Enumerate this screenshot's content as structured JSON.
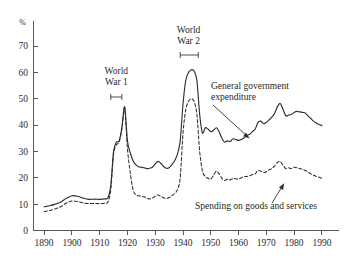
{
  "chart_data": {
    "type": "line",
    "title": "",
    "xlabel": "",
    "ylabel": "%",
    "ylim": [
      0,
      75
    ],
    "xlim": [
      1886,
      1994
    ],
    "grid": false,
    "legend_position": "inline-annotations",
    "y_ticks": [
      "0",
      "10",
      "20",
      "30",
      "40",
      "50",
      "60",
      "70"
    ],
    "y_tick_values": [
      0,
      10,
      20,
      30,
      40,
      50,
      60,
      70
    ],
    "x_ticks": [
      "1890",
      "1900",
      "1910",
      "1920",
      "1930",
      "1940",
      "1950",
      "1960",
      "1970",
      "1980",
      "1990"
    ],
    "x_tick_values": [
      1890,
      1900,
      1910,
      1920,
      1930,
      1940,
      1950,
      1960,
      1970,
      1980,
      1990
    ],
    "annotations": [
      {
        "name": "world-war-1",
        "line1": "World",
        "line2": "War 1",
        "span": [
          1914,
          1918
        ]
      },
      {
        "name": "world-war-2",
        "line1": "World",
        "line2": "War 2",
        "span": [
          1939,
          1945
        ]
      },
      {
        "name": "general-government-expenditure",
        "line1": "General government",
        "line2": "expenditure"
      },
      {
        "name": "spending-on-goods-and-services",
        "line1": "Spending on goods and services",
        "line2": ""
      }
    ],
    "series": [
      {
        "name": "General government expenditure",
        "style": "solid",
        "x": [
          1890,
          1892,
          1894,
          1896,
          1898,
          1900,
          1902,
          1904,
          1906,
          1908,
          1910,
          1912,
          1913,
          1914,
          1915,
          1916,
          1917,
          1918,
          1919,
          1920,
          1921,
          1922,
          1923,
          1924,
          1925,
          1926,
          1927,
          1928,
          1929,
          1930,
          1931,
          1932,
          1933,
          1934,
          1935,
          1936,
          1937,
          1938,
          1939,
          1940,
          1941,
          1942,
          1943,
          1944,
          1945,
          1946,
          1947,
          1948,
          1949,
          1950,
          1951,
          1952,
          1953,
          1954,
          1955,
          1956,
          1957,
          1958,
          1959,
          1960,
          1961,
          1962,
          1963,
          1964,
          1965,
          1966,
          1967,
          1968,
          1969,
          1970,
          1971,
          1972,
          1973,
          1974,
          1975,
          1976,
          1977,
          1978,
          1979,
          1980,
          1981,
          1982,
          1983,
          1984,
          1985,
          1986,
          1987,
          1988,
          1989,
          1990
        ],
        "y": [
          9.0,
          9.4,
          10.0,
          10.8,
          12.2,
          13.2,
          13.0,
          12.3,
          11.8,
          11.9,
          11.8,
          12.0,
          12.4,
          17.0,
          30.0,
          33.5,
          34.0,
          39.0,
          47.0,
          34.0,
          29.5,
          26.5,
          25.0,
          24.2,
          24.0,
          23.8,
          23.5,
          23.6,
          24.0,
          25.3,
          26.2,
          25.5,
          24.3,
          23.6,
          23.8,
          25.0,
          26.5,
          29.0,
          34.0,
          48.0,
          57.0,
          60.0,
          61.0,
          60.5,
          57.0,
          44.0,
          37.0,
          39.0,
          38.5,
          37.5,
          38.0,
          39.0,
          37.5,
          35.0,
          33.5,
          34.0,
          33.8,
          34.8,
          34.5,
          34.2,
          34.5,
          35.2,
          36.0,
          36.5,
          37.5,
          38.5,
          41.0,
          41.5,
          40.5,
          41.0,
          42.0,
          43.0,
          44.5,
          47.0,
          48.2,
          46.0,
          43.5,
          43.8,
          44.0,
          44.8,
          45.2,
          45.0,
          44.8,
          44.6,
          43.5,
          42.5,
          41.5,
          40.8,
          40.2,
          39.8
        ]
      },
      {
        "name": "Spending on goods and services",
        "style": "dashed",
        "x": [
          1890,
          1892,
          1894,
          1896,
          1898,
          1900,
          1902,
          1904,
          1906,
          1908,
          1910,
          1912,
          1913,
          1914,
          1915,
          1916,
          1917,
          1918,
          1919,
          1920,
          1921,
          1922,
          1923,
          1924,
          1925,
          1926,
          1927,
          1928,
          1929,
          1930,
          1931,
          1932,
          1933,
          1934,
          1935,
          1936,
          1937,
          1938,
          1939,
          1940,
          1941,
          1942,
          1943,
          1944,
          1945,
          1946,
          1947,
          1948,
          1949,
          1950,
          1951,
          1952,
          1953,
          1954,
          1955,
          1956,
          1957,
          1958,
          1959,
          1960,
          1961,
          1962,
          1963,
          1964,
          1965,
          1966,
          1967,
          1968,
          1969,
          1970,
          1971,
          1972,
          1973,
          1974,
          1975,
          1976,
          1977,
          1978,
          1979,
          1980,
          1981,
          1982,
          1983,
          1984,
          1985,
          1986,
          1987,
          1988,
          1989,
          1990
        ],
        "y": [
          7.2,
          7.6,
          8.2,
          9.0,
          10.4,
          11.2,
          11.0,
          10.5,
          10.2,
          10.3,
          10.2,
          10.4,
          10.8,
          15.5,
          29.0,
          32.5,
          33.5,
          38.5,
          46.5,
          31.0,
          22.0,
          15.5,
          13.5,
          13.2,
          13.0,
          12.8,
          12.2,
          12.0,
          12.3,
          13.0,
          13.5,
          13.0,
          12.4,
          12.2,
          12.5,
          13.2,
          14.0,
          15.5,
          20.0,
          37.0,
          46.0,
          49.0,
          50.0,
          49.0,
          44.0,
          30.0,
          22.5,
          20.5,
          19.8,
          19.5,
          21.0,
          22.5,
          21.5,
          19.8,
          19.0,
          19.5,
          19.2,
          19.8,
          19.6,
          19.5,
          20.0,
          20.5,
          20.5,
          20.8,
          21.2,
          21.5,
          22.8,
          22.5,
          22.0,
          22.3,
          23.0,
          23.5,
          24.5,
          25.8,
          26.2,
          24.8,
          23.5,
          23.8,
          23.5,
          24.0,
          23.8,
          23.5,
          23.2,
          22.8,
          22.2,
          21.5,
          21.0,
          20.5,
          20.2,
          19.8
        ]
      }
    ]
  }
}
